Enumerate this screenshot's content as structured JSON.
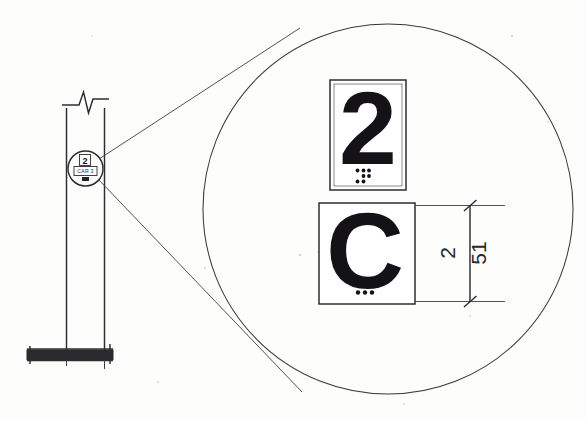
{
  "drawing": {
    "title": "Elevator Car Designation Sign Detail",
    "background_color": "#fdfdfc",
    "ink_color": "#333135"
  },
  "elevation": {
    "name": "post-mounted-sign-elevation",
    "post": {
      "label": "sign-post",
      "break_symbol": "break-line"
    },
    "ground": {
      "label": "ground-slab",
      "fill_color": "#2b292d"
    },
    "callout": {
      "label": "detail-callout-circle",
      "tag_text": "CAR 3"
    }
  },
  "detail": {
    "name": "enlarged-detail",
    "circle_label": "detail-enlargement-circle",
    "leader_label": "detail-leader-lines",
    "plates": [
      {
        "id": "plate-floor-number",
        "character": "2",
        "braille_label": "braille-cell-2",
        "braille_dots": [
          [
            1,
            0
          ],
          [
            1,
            1
          ],
          [
            0,
            1
          ],
          [
            1,
            0
          ]
        ]
      },
      {
        "id": "plate-car-letter",
        "character": "C",
        "braille_label": "braille-cell-c",
        "braille_dots": [
          [
            1,
            1,
            1
          ]
        ]
      }
    ]
  },
  "dimension": {
    "name": "plate-height-dimension",
    "imperial_value": "2",
    "metric_value": "51",
    "tick_style": "architectural-slash"
  }
}
